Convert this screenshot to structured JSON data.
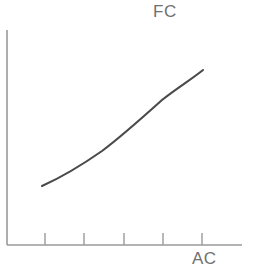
{
  "figure": {
    "background_color": "#ffffff",
    "width": 256,
    "height": 273
  },
  "labels": {
    "series_label": "FC",
    "xaxis_label": "AC"
  },
  "style": {
    "axis_color": "#9a9a9a",
    "curve_color": "#4a4a4a",
    "label_color": "#707070"
  },
  "chart_data": {
    "type": "line",
    "title": "",
    "subtitle": "",
    "xlabel": "AC",
    "ylabel": "",
    "legend": [
      "FC"
    ],
    "legend_position": "top-right-inline",
    "grid": false,
    "annotations": [
      "FC",
      "AC"
    ],
    "axis_geometry": {
      "y_axis_x": 7,
      "y_axis_top": 30,
      "y_axis_bottom": 245,
      "x_axis_y": 245,
      "x_axis_left": 7,
      "x_axis_right": 242,
      "tick_positions_x": [
        45,
        84,
        124,
        163,
        202
      ],
      "tick_length": 12,
      "tick_count": 5
    },
    "xlim": [
      0,
      1
    ],
    "ylim": [
      0,
      1
    ],
    "series": [
      {
        "name": "FC",
        "points": [
          [
            42,
            186
          ],
          [
            55,
            178
          ],
          [
            70,
            172
          ],
          [
            85,
            163
          ],
          [
            100,
            153
          ],
          [
            115,
            140
          ],
          [
            122,
            133
          ],
          [
            135,
            122
          ],
          [
            145,
            114
          ],
          [
            155,
            107
          ],
          [
            170,
            95
          ],
          [
            180,
            89
          ],
          [
            195,
            80
          ],
          [
            203,
            70
          ]
        ],
        "path": "M 42 186 C 62 177, 82 165, 102 151 C 122 136, 142 118, 162 100 C 177 88, 192 79, 203 70",
        "shape": "increasing-convex"
      }
    ]
  }
}
